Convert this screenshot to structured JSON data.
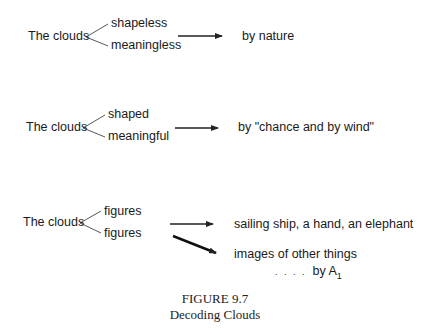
{
  "figure": {
    "label": "FIGURE 9.7",
    "title": "Decoding Clouds"
  },
  "rows": [
    {
      "subject": "The clouds",
      "branches": [
        "shapeless",
        "meaningless"
      ],
      "results": [
        "by nature"
      ]
    },
    {
      "subject": "The clouds",
      "branches": [
        "shaped",
        "meaningful"
      ],
      "results": [
        "by \"chance and by wind\""
      ]
    },
    {
      "subject": "The clouds",
      "branches": [
        "figures",
        "figures"
      ],
      "results": [
        "sailing ship, a hand, an elephant",
        "images of other things"
      ],
      "attribution": {
        "dots": ". . . .",
        "prefix": "by A",
        "subscript": "1"
      }
    }
  ],
  "colors": {
    "text": "#1a1a1a",
    "line": "#333333",
    "background": "#ffffff"
  }
}
